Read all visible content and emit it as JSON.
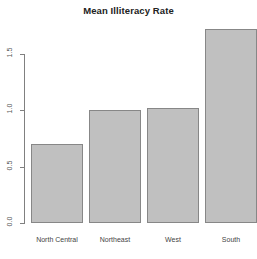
{
  "chart_data": {
    "type": "bar",
    "title": "Mean Illiteracy Rate",
    "xlabel": "",
    "ylabel": "",
    "categories": [
      "North Central",
      "Northeast",
      "West",
      "South"
    ],
    "values": [
      0.7,
      1.0,
      1.02,
      1.72
    ],
    "ylim": [
      0,
      1.75
    ],
    "yticks": [
      0.0,
      0.5,
      1.0,
      1.5
    ],
    "ytick_labels": [
      "0.0",
      "0.5",
      "1.0",
      "1.5"
    ],
    "grid": false,
    "legend": false,
    "bar_fill_color": "#c0c0c0",
    "bar_border_color": "#878787",
    "axis_color": "#808080",
    "background_color": "#ffffff"
  }
}
